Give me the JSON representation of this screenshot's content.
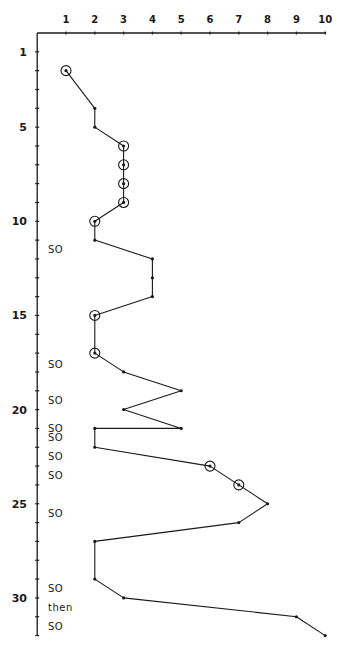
{
  "chart_data": {
    "type": "line",
    "title": "",
    "xlabel": "",
    "ylabel": "",
    "xlim": [
      0,
      10
    ],
    "ylim": [
      0,
      32
    ],
    "x_axis_position": "top",
    "y_axis_inverted": true,
    "grid": false,
    "x_ticks": [
      1,
      2,
      3,
      4,
      5,
      6,
      7,
      8,
      9,
      10
    ],
    "y_tick_labels": [
      1,
      5,
      10,
      15,
      20,
      25,
      30
    ],
    "y_minor_ticks": [
      1,
      2,
      3,
      4,
      5,
      6,
      7,
      8,
      9,
      10,
      11,
      12,
      13,
      14,
      15,
      16,
      17,
      18,
      19,
      20,
      21,
      22,
      23,
      24,
      25,
      26,
      27,
      28,
      29,
      30,
      31,
      32
    ],
    "points": [
      {
        "y": 2,
        "x": 1,
        "circled": true
      },
      {
        "y": 4,
        "x": 2,
        "circled": false
      },
      {
        "y": 5,
        "x": 2,
        "circled": false
      },
      {
        "y": 6,
        "x": 3,
        "circled": true
      },
      {
        "y": 7,
        "x": 3,
        "circled": true
      },
      {
        "y": 8,
        "x": 3,
        "circled": true
      },
      {
        "y": 9,
        "x": 3,
        "circled": true
      },
      {
        "y": 10,
        "x": 2,
        "circled": true
      },
      {
        "y": 11,
        "x": 2,
        "circled": false
      },
      {
        "y": 12,
        "x": 4,
        "circled": false
      },
      {
        "y": 13,
        "x": 4,
        "circled": false
      },
      {
        "y": 14,
        "x": 4,
        "circled": false
      },
      {
        "y": 15,
        "x": 2,
        "circled": true
      },
      {
        "y": 17,
        "x": 2,
        "circled": true
      },
      {
        "y": 18,
        "x": 3,
        "circled": false
      },
      {
        "y": 19,
        "x": 5,
        "circled": false
      },
      {
        "y": 20,
        "x": 3,
        "circled": false
      },
      {
        "y": 21,
        "x": 5,
        "circled": false
      },
      {
        "y": 21,
        "x": 2,
        "circled": false
      },
      {
        "y": 22,
        "x": 2,
        "circled": false
      },
      {
        "y": 23,
        "x": 6,
        "circled": true
      },
      {
        "y": 24,
        "x": 7,
        "circled": true
      },
      {
        "y": 25,
        "x": 8,
        "circled": false
      },
      {
        "y": 26,
        "x": 7,
        "circled": false
      },
      {
        "y": 27,
        "x": 2,
        "circled": false
      },
      {
        "y": 29,
        "x": 2,
        "circled": false
      },
      {
        "y": 30,
        "x": 3,
        "circled": false
      },
      {
        "y": 31,
        "x": 9,
        "circled": false
      },
      {
        "y": 32,
        "x": 10,
        "circled": false
      }
    ],
    "annotations": [
      {
        "text": "SO",
        "y": 11.5
      },
      {
        "text": "SO",
        "y": 17.6
      },
      {
        "text": "SO",
        "y": 19.5
      },
      {
        "text": "SO",
        "y": 21.0
      },
      {
        "text": "SO",
        "y": 21.5
      },
      {
        "text": "SO",
        "y": 22.5
      },
      {
        "text": "SO",
        "y": 23.5
      },
      {
        "text": "SO",
        "y": 25.5
      },
      {
        "text": "SO",
        "y": 29.5
      },
      {
        "text": "then",
        "y": 30.5
      },
      {
        "text": "SO",
        "y": 31.5
      }
    ],
    "colors": {
      "line": "#1a1a1a",
      "axis": "#1a1a1a",
      "background": "#ffffff"
    }
  }
}
